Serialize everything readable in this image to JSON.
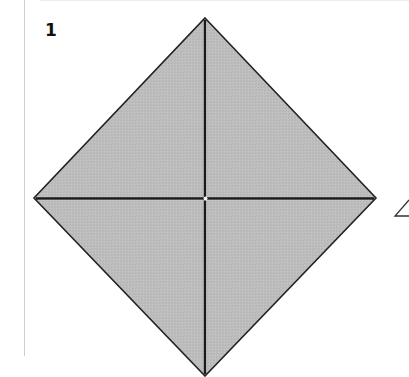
{
  "figure": {
    "step_number": "1",
    "shape": "square-on-point",
    "fill_color": "#bdbdbd",
    "outline_color": "#222222",
    "crease_color": "#1a1a1a",
    "vertices": {
      "top": [
        205,
        18
      ],
      "right": [
        376,
        198
      ],
      "bottom": [
        205,
        376
      ],
      "left": [
        34,
        198
      ]
    },
    "creases": [
      {
        "name": "vertical-crease",
        "from": [
          205,
          18
        ],
        "to": [
          205,
          376
        ]
      },
      {
        "name": "horizontal-crease",
        "from": [
          34,
          198
        ],
        "to": [
          376,
          198
        ]
      }
    ],
    "edge_marker": {
      "icon": "angle-arrow-icon",
      "glyph": "∠"
    }
  }
}
